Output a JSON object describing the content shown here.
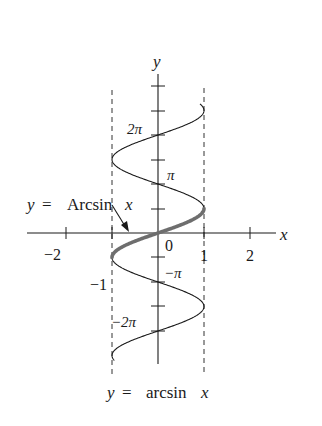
{
  "figure": {
    "axis_labels": {
      "x": "x",
      "y": "y"
    },
    "x_ticks": [
      {
        "value": -2,
        "label": "−2"
      },
      {
        "value": -1,
        "label": "−1"
      },
      {
        "value": 0,
        "label": "0"
      },
      {
        "value": 1,
        "label": "1"
      },
      {
        "value": 2,
        "label": "2"
      }
    ],
    "y_tick_labels": {
      "two_pi": "2π",
      "pi": "π",
      "neg_pi": "−π",
      "neg_two_pi": "−2π"
    },
    "annotation": {
      "text_y": "y",
      "text_eq": "=",
      "text_fn": "Arcsin",
      "text_x": "x"
    },
    "caption": {
      "y": "y",
      "eq": "=",
      "fn": "arcsin",
      "x": "x"
    },
    "colors": {
      "axis": "#1a1a1a",
      "curve": "#1a1a1a",
      "principal_branch": "#6e6e6e",
      "asymptote": "#333333"
    }
  }
}
